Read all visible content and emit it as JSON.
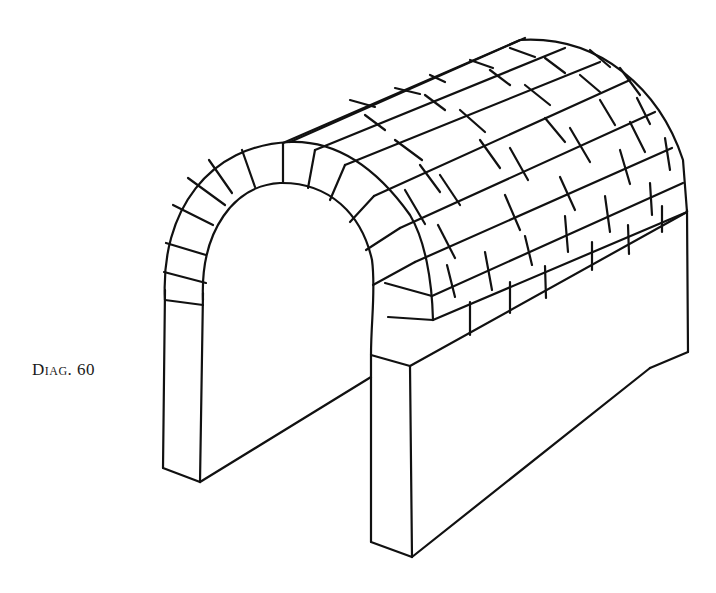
{
  "diagram": {
    "caption": "Diag. 60",
    "stroke_color": "#111111",
    "background_color": "#ffffff"
  }
}
